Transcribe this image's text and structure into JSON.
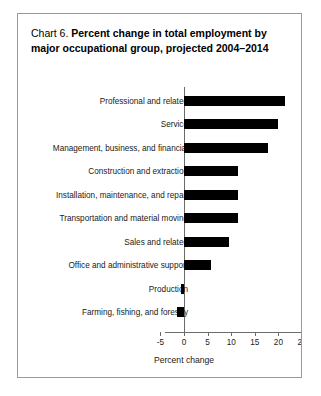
{
  "card": {
    "title_number": "Chart 6.",
    "title_text": "Percent change in total employment by major occupational group, projected 2004–2014"
  },
  "chart_data": {
    "type": "bar",
    "orientation": "horizontal",
    "title": "Chart 6.  Percent change in total employment by major occupational group, projected 2004–2014",
    "xlabel": "Percent change",
    "ylabel": "",
    "xlim": [
      -5,
      25
    ],
    "xticks": [
      -5,
      0,
      5,
      10,
      15,
      20,
      25
    ],
    "xtick_labels": [
      "-5",
      "0",
      "5",
      "10",
      "15",
      "20",
      "25"
    ],
    "grid": false,
    "legend": false,
    "bar_color": "#000000",
    "categories": [
      "Professional and related",
      "Service",
      "Management, business, and financial",
      "Construction and extraction",
      "Installation, maintenance, and repair",
      "Transportation and material moving",
      "Sales and related",
      "Office and administrative support",
      "Production",
      "Farming, fishing, and forestry"
    ],
    "values": [
      21.5,
      20.0,
      17.9,
      11.4,
      11.4,
      11.4,
      9.6,
      5.8,
      -0.6,
      -1.4
    ]
  }
}
